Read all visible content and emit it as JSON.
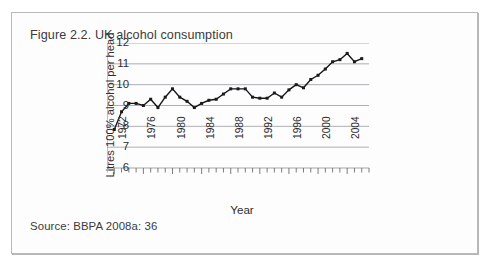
{
  "figure": {
    "title": "Figure 2.2. UK alcohol consumption",
    "source": "Source: BBPA 2008a: 36"
  },
  "chart_data": {
    "type": "line",
    "title": "",
    "xlabel": "Year",
    "ylabel": "Litres 100% alcohol per head",
    "xlim": [
      1971,
      2007
    ],
    "ylim": [
      6,
      12
    ],
    "ytick_labels": [
      "12",
      "11",
      "10",
      "9",
      "8",
      "7",
      "6"
    ],
    "yticks": [
      12,
      11,
      10,
      9,
      8,
      7,
      6
    ],
    "xtick_labels": [
      "1972",
      "1976",
      "1980",
      "1984",
      "1988",
      "1992",
      "1996",
      "2000",
      "2004"
    ],
    "xticks": [
      1972,
      1976,
      1980,
      1984,
      1988,
      1992,
      1996,
      2000,
      2004
    ],
    "minor_tick_interval": 1,
    "grid": "horizontal",
    "legend": "none",
    "line_color": "#1a1a1a",
    "marker": "square",
    "x": [
      1972,
      1973,
      1974,
      1975,
      1976,
      1977,
      1978,
      1979,
      1980,
      1981,
      1982,
      1983,
      1984,
      1985,
      1986,
      1987,
      1988,
      1989,
      1990,
      1991,
      1992,
      1993,
      1994,
      1995,
      1996,
      1997,
      1998,
      1999,
      2000,
      2001,
      2002,
      2003,
      2004,
      2005,
      2006
    ],
    "values": [
      7.85,
      8.7,
      9.1,
      9.1,
      9.0,
      9.3,
      8.9,
      9.4,
      9.8,
      9.4,
      9.2,
      8.9,
      9.1,
      9.25,
      9.3,
      9.55,
      9.8,
      9.8,
      9.8,
      9.4,
      9.35,
      9.35,
      9.6,
      9.4,
      9.75,
      10.0,
      9.85,
      10.25,
      10.45,
      10.75,
      11.1,
      11.2,
      11.5,
      11.1,
      11.25
    ],
    "series_name": "UK alcohol consumption"
  }
}
